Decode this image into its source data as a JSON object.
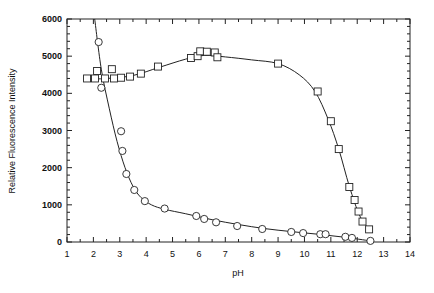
{
  "chart_data": {
    "type": "scatter",
    "title": "",
    "xlabel": "pH",
    "ylabel": "Relative Fluorescence Intensity",
    "xlim": [
      1,
      14
    ],
    "ylim": [
      0,
      6000
    ],
    "xticks": [
      1,
      2,
      3,
      4,
      5,
      6,
      7,
      8,
      9,
      10,
      11,
      12,
      13,
      14
    ],
    "yticks": [
      0,
      1000,
      2000,
      3000,
      4000,
      5000,
      6000
    ],
    "grid": false,
    "legend": null,
    "series": [
      {
        "name": "squares",
        "marker": "square",
        "x": [
          1.76,
          2.06,
          2.14,
          2.44,
          2.7,
          2.78,
          3.05,
          3.39,
          3.8,
          4.45,
          5.7,
          5.95,
          6.05,
          6.3,
          6.6,
          6.7,
          9.0,
          10.5,
          11.0,
          11.3,
          11.7,
          11.9,
          12.05,
          12.2,
          12.45
        ],
        "y": [
          4400,
          4400,
          4600,
          4400,
          4650,
          4400,
          4420,
          4450,
          4530,
          4720,
          4950,
          5000,
          5130,
          5120,
          5100,
          4970,
          4800,
          4050,
          3250,
          2500,
          1480,
          1130,
          820,
          550,
          340
        ]
      },
      {
        "name": "circles",
        "marker": "circle",
        "x": [
          2.2,
          2.3,
          3.05,
          3.1,
          3.25,
          3.55,
          3.95,
          4.7,
          5.9,
          6.2,
          6.65,
          7.45,
          8.4,
          9.5,
          9.95,
          10.6,
          10.8,
          11.55,
          11.8,
          12.5
        ],
        "y": [
          5380,
          4150,
          2980,
          2450,
          1830,
          1400,
          1100,
          900,
          700,
          620,
          530,
          430,
          350,
          270,
          240,
          210,
          210,
          140,
          110,
          30
        ]
      }
    ],
    "fit_curves": [
      {
        "name": "squares-fit",
        "x": [
          1.7,
          2.5,
          3.5,
          4.5,
          5.5,
          6.2,
          7,
          8,
          9,
          9.8,
          10.4,
          10.9,
          11.3,
          11.7,
          12.1,
          12.5
        ],
        "y": [
          4380,
          4400,
          4480,
          4700,
          4920,
          5020,
          4980,
          4900,
          4800,
          4500,
          4050,
          3300,
          2500,
          1500,
          700,
          300
        ]
      },
      {
        "name": "circles-fit",
        "x": [
          2.05,
          2.3,
          2.6,
          2.9,
          3.2,
          3.5,
          3.8,
          4.2,
          4.7,
          5.5,
          6.5,
          7.5,
          8.5,
          9.5,
          10.5,
          11.5,
          12.5
        ],
        "y": [
          6000,
          4650,
          3600,
          2700,
          2000,
          1500,
          1200,
          1000,
          880,
          760,
          600,
          470,
          360,
          280,
          210,
          130,
          30
        ]
      }
    ]
  }
}
